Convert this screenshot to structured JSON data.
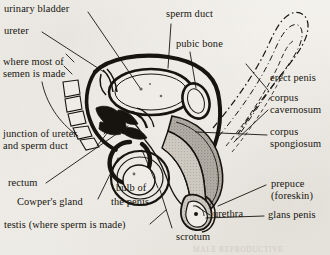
{
  "figure": {
    "caption_bleed": "MALE REPRODUCTIVE",
    "ink_color": "#17140f",
    "paper_color": "#f2f0ec",
    "shade_color": "#9a968e",
    "light_shade_color": "#c8c4bc"
  },
  "labels": {
    "urinary_bladder": "urinary bladder",
    "ureter": "ureter",
    "where_semen_line1": "where most of",
    "where_semen_line2": "semen is made",
    "junction_line1": "junction of ureter",
    "junction_line2": "and sperm duct",
    "rectum": "rectum",
    "cowpers_gland": "Cowper's gland",
    "testis": "testis (where sperm is made)",
    "bulb_line1": "bulb of",
    "bulb_line2": "the penis",
    "scrotum": "scrotum",
    "sperm_duct": "sperm duct",
    "pubic_bone": "pubic bone",
    "erect_penis": "erect penis",
    "corpus_cavernosum_line1": "corpus",
    "corpus_cavernosum_line2": "cavernosum",
    "corpus_spongiosum_line1": "corpus",
    "corpus_spongiosum_line2": "spongiosum",
    "prepuce_line1": "prepuce",
    "prepuce_line2": "(foreskin)",
    "urethra": "urethra",
    "glans_penis": "glans penis"
  }
}
